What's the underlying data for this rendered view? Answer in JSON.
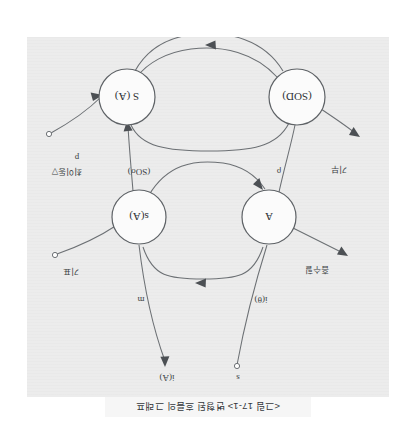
{
  "page": {
    "background_color": "#ffffff",
    "paper_color": "#ececec",
    "ink_color": "#5e6266",
    "orientation": "upside-down-scan-180deg",
    "width": 417,
    "height": 433
  },
  "figure": {
    "caption": "<그림 17-1> 변형된 흐름의 그래프",
    "type": "flow-graph",
    "node_count": 4,
    "edge_count": 10
  },
  "nodes": [
    {
      "id": "A",
      "label": "A",
      "cx": 120,
      "cy": 180,
      "r": 27
    },
    {
      "id": "sA",
      "label": "s(A)",
      "cx": 250,
      "cy": 180,
      "r": 27
    },
    {
      "id": "SOD",
      "label": "(SOD)",
      "cx": 92,
      "cy": 300,
      "r": 28
    },
    {
      "id": "S_A",
      "label": "S (A)",
      "cx": 262,
      "cy": 300,
      "r": 28
    }
  ],
  "edge_labels": {
    "top_left": "s",
    "top_right": "i(A)",
    "mid_left": "i(θ)",
    "mid_right": "m",
    "left_upper": "흡수힐",
    "right_upper": "기표",
    "left_lower": "기부",
    "right_lower_inner": "(SOσ)",
    "right_lower": "최이동▽",
    "rho": "ρ",
    "p": "p"
  },
  "terminals": {
    "top_left_open": "s",
    "top_right_arrow": "i(A)",
    "right_upper_open": "기표",
    "left_upper_arrow": "흡수힐",
    "left_lower_arrow": "기부",
    "right_lower_open": "최이동▽"
  }
}
